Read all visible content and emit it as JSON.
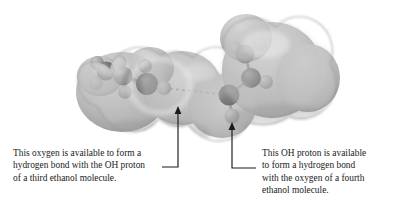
{
  "figure": {
    "background_color": "#ffffff",
    "surface_color": "#b9b9b9",
    "surface_highlight_color": "#e2e2e2",
    "surface_shadow_color": "#8d8d8d",
    "carbon_color": "#6f6f6f",
    "oxygen_color": "#4a4a4a",
    "hydrogen_color": "#a6a6a6",
    "bond_color": "#7a7a7a",
    "leader_color": "#1a1a1a",
    "molecules": [
      {
        "name": "ethanol-molecule-left",
        "atoms": [
          {
            "element": "H",
            "label": "methyl-hydrogen",
            "cx": 97,
            "cy": 63,
            "r": 7.0
          },
          {
            "element": "C",
            "label": "methyl-carbon",
            "cx": 106,
            "cy": 71,
            "r": 9.5
          },
          {
            "element": "H",
            "label": "methyl-hydrogen",
            "cx": 96,
            "cy": 83,
            "r": 7.0
          },
          {
            "element": "C",
            "label": "methylene-carbon",
            "cx": 123,
            "cy": 76,
            "r": 9.5
          },
          {
            "element": "H",
            "label": "methylene-hydrogen",
            "cx": 120,
            "cy": 62,
            "r": 6.8
          },
          {
            "element": "H",
            "label": "methylene-hydrogen",
            "cx": 125,
            "cy": 92,
            "r": 6.8
          },
          {
            "element": "O",
            "label": "hydroxyl-oxygen",
            "cx": 147,
            "cy": 84,
            "r": 11.0
          },
          {
            "element": "H",
            "label": "hydroxyl-hydrogen",
            "cx": 164,
            "cy": 88,
            "r": 7.2
          },
          {
            "element": "H",
            "label": "hydroxyl-hydrogen",
            "cx": 145,
            "cy": 66,
            "r": 7.0
          }
        ]
      },
      {
        "name": "ethanol-molecule-right",
        "atoms": [
          {
            "element": "H",
            "label": "methyl-hydrogen",
            "cx": 260,
            "cy": 44,
            "r": 7.0
          },
          {
            "element": "C",
            "label": "methyl-carbon",
            "cx": 245,
            "cy": 54,
            "r": 9.5
          },
          {
            "element": "H",
            "label": "methyl-hydrogen",
            "cx": 235,
            "cy": 48,
            "r": 6.8
          },
          {
            "element": "C",
            "label": "methylene-carbon",
            "cx": 251,
            "cy": 78,
            "r": 10.0
          },
          {
            "element": "H",
            "label": "methylene-hydrogen",
            "cx": 266,
            "cy": 82,
            "r": 7.0
          },
          {
            "element": "O",
            "label": "hydroxyl-oxygen",
            "cx": 229,
            "cy": 95,
            "r": 10.5
          },
          {
            "element": "H",
            "label": "hydroxyl-hydrogen",
            "cx": 232,
            "cy": 116,
            "r": 7.5
          }
        ]
      }
    ],
    "annotations": [
      {
        "name": "left-annotation",
        "target_label": "hydroxyl-oxygen-left",
        "arrow_tip": {
          "x": 178,
          "y": 109
        },
        "elbow": {
          "x": 178,
          "y": 167
        },
        "text_anchor": {
          "x": 162,
          "y": 167
        },
        "lines": [
          "This oxygen is available to form a",
          "hydrogen bond with the OH proton",
          "of a third ethanol molecule."
        ]
      },
      {
        "name": "right-annotation",
        "target_label": "hydroxyl-hydrogen-right",
        "arrow_tip": {
          "x": 232,
          "y": 125
        },
        "elbow": {
          "x": 232,
          "y": 168
        },
        "text_anchor": {
          "x": 256,
          "y": 168
        },
        "lines": [
          "This OH proton is available",
          "to form a hydrogen bond",
          "with the oxygen of a fourth",
          "ethanol molecule."
        ]
      }
    ]
  }
}
